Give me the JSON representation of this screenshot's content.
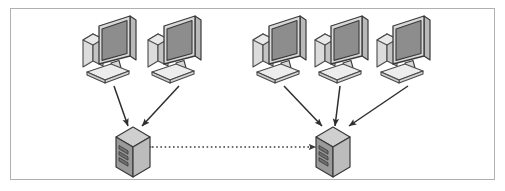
{
  "diagram": {
    "type": "network-topology",
    "canvas": {
      "width": 505,
      "height": 191,
      "background": "#ffffff"
    },
    "frame": {
      "name": "diagram-border",
      "x": 10.5,
      "y": 8.5,
      "width": 484,
      "height": 171,
      "stroke": "#b0b0b0",
      "stroke_width": 1,
      "fill": "#ffffff"
    },
    "palette": {
      "screen_fill": "#8d8d8d",
      "screen_stroke": "#3a3a3a",
      "bezel_fill": "#d8d8d8",
      "tower_fill": "#dcdcdc",
      "keyboard_fill": "#ededed",
      "outline": "#4a4a4a",
      "server_top": "#cfcfcf",
      "server_front": "#9a9a9a",
      "server_side": "#b8b8b8",
      "server_slot": "#6f6f6f",
      "arrow": "#2e2e2e",
      "dotted_link": "#3c3c3c"
    },
    "groups": [
      {
        "name": "left-site",
        "label": "Left site",
        "client_count": 2,
        "server_name": "left-server"
      },
      {
        "name": "right-site",
        "label": "Right site",
        "client_count": 3,
        "server_name": "right-server"
      }
    ],
    "clients": [
      {
        "id": "client-1",
        "group": "left-site",
        "x": 81,
        "y": 14,
        "scale": 1.0
      },
      {
        "id": "client-2",
        "group": "left-site",
        "x": 146,
        "y": 14,
        "scale": 1.0
      },
      {
        "id": "client-3",
        "group": "right-site",
        "x": 251,
        "y": 14,
        "scale": 1.0
      },
      {
        "id": "client-4",
        "group": "right-site",
        "x": 313,
        "y": 14,
        "scale": 1.0
      },
      {
        "id": "client-5",
        "group": "right-site",
        "x": 375,
        "y": 14,
        "scale": 1.0
      }
    ],
    "servers": [
      {
        "id": "left-server",
        "group": "left-site",
        "x": 113,
        "y": 125,
        "scale": 1.0
      },
      {
        "id": "right-server",
        "group": "right-site",
        "x": 313,
        "y": 125,
        "scale": 1.0
      }
    ],
    "connections": [
      {
        "id": "link-c1-left",
        "from": "client-1",
        "to": "left-server",
        "style": "solid",
        "direction": "one-way",
        "x1": 114,
        "y1": 86,
        "x2": 128,
        "y2": 126
      },
      {
        "id": "link-c2-left",
        "from": "client-2",
        "to": "left-server",
        "style": "solid",
        "direction": "one-way",
        "x1": 179,
        "y1": 86,
        "x2": 142,
        "y2": 126
      },
      {
        "id": "link-c3-right",
        "from": "client-3",
        "to": "right-server",
        "style": "solid",
        "direction": "one-way",
        "x1": 284,
        "y1": 86,
        "x2": 322,
        "y2": 126
      },
      {
        "id": "link-c4-right",
        "from": "client-4",
        "to": "right-server",
        "style": "solid",
        "direction": "one-way",
        "x1": 340,
        "y1": 86,
        "x2": 335,
        "y2": 126
      },
      {
        "id": "link-c5-right",
        "from": "client-5",
        "to": "right-server",
        "style": "solid",
        "direction": "one-way",
        "x1": 408,
        "y1": 86,
        "x2": 349,
        "y2": 126
      },
      {
        "id": "link-server-server",
        "from": "left-server",
        "to": "right-server",
        "style": "dotted",
        "direction": "bidirectional",
        "x1": 152,
        "y1": 147,
        "x2": 316,
        "y2": 147
      }
    ]
  }
}
